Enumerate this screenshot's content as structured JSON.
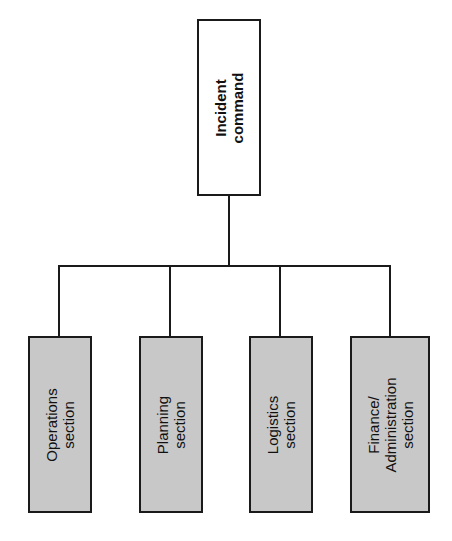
{
  "diagram": {
    "type": "org-chart",
    "orientation": "labels rotated 90 degrees counter-clockwise",
    "colors": {
      "line": "#1a1a1a",
      "top_box_fill": "#ffffff",
      "section_fill": "#c8c8c8"
    },
    "root": {
      "label": "Incident\ncommand"
    },
    "sections": [
      {
        "label": "Operations\nsection"
      },
      {
        "label": "Planning\nsection"
      },
      {
        "label": "Logistics\nsection"
      },
      {
        "label": "Finance/\nAdministration\nsection"
      }
    ]
  }
}
